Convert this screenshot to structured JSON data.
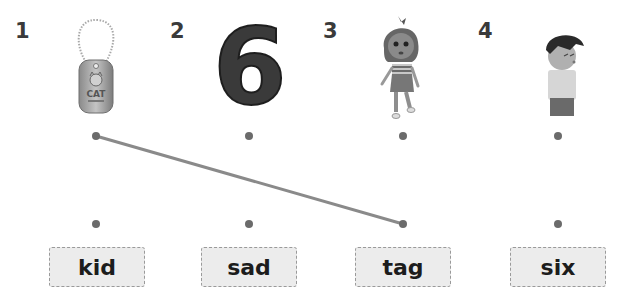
{
  "exercise": {
    "items": [
      {
        "number": "1",
        "picture": "cat-dog-tag"
      },
      {
        "number": "2",
        "picture": "number-six"
      },
      {
        "number": "3",
        "picture": "girl-walking"
      },
      {
        "number": "4",
        "picture": "sad-boy"
      }
    ],
    "words": [
      "kid",
      "sad",
      "tag",
      "six"
    ],
    "connections": [
      {
        "from_item": 1,
        "to_word": "tag"
      }
    ],
    "tag_text": "CAT",
    "digit": "6",
    "colors": {
      "dot": "#6b6b6b",
      "line": "#8a8a8a",
      "box_fill": "#ececec",
      "box_border": "#9a9a9a",
      "text": "#1c1c1c"
    }
  }
}
